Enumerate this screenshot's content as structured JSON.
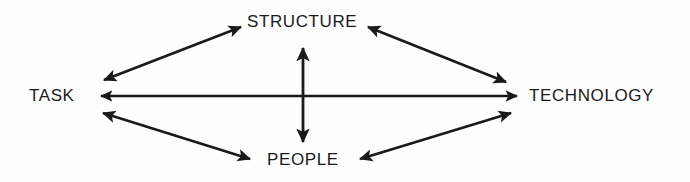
{
  "diagram": {
    "background_color": "#fefefe",
    "line_color": "#1a1a1a",
    "text_color": "#1a1a1a",
    "nodes": [
      {
        "id": "structure",
        "label": "STRUCTURE",
        "position": "top"
      },
      {
        "id": "task",
        "label": "TASK",
        "position": "left"
      },
      {
        "id": "technology",
        "label": "TECHNOLOGY",
        "position": "right"
      },
      {
        "id": "people",
        "label": "PEOPLE",
        "position": "bottom"
      }
    ],
    "connectors": [
      {
        "id": "task-structure",
        "from": "TASK",
        "to": "STRUCTURE",
        "style": "double-headed-arrow"
      },
      {
        "id": "structure-technology",
        "from": "STRUCTURE",
        "to": "TECHNOLOGY",
        "style": "double-headed-arrow"
      },
      {
        "id": "task-technology",
        "from": "TASK",
        "to": "TECHNOLOGY",
        "style": "double-headed-arrow"
      },
      {
        "id": "task-people",
        "from": "TASK",
        "to": "PEOPLE",
        "style": "double-headed-arrow"
      },
      {
        "id": "people-technology",
        "from": "PEOPLE",
        "to": "TECHNOLOGY",
        "style": "double-headed-arrow"
      },
      {
        "id": "structure-people",
        "from": "STRUCTURE",
        "to": "PEOPLE",
        "style": "double-headed-arrow"
      }
    ]
  }
}
